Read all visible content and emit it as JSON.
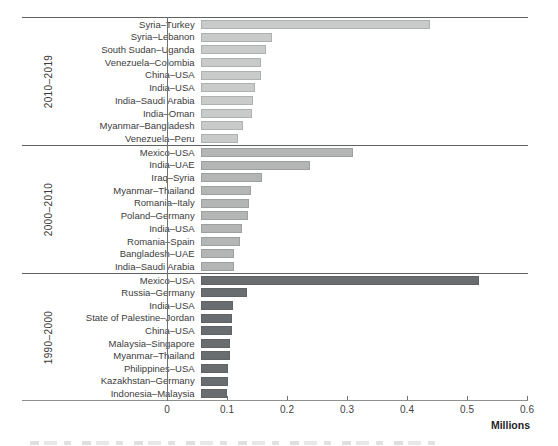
{
  "chart_data": {
    "type": "bar",
    "orientation": "horizontal",
    "xlabel": "Millions",
    "xlim": [
      0,
      0.6
    ],
    "x_ticks": [
      "0",
      "0.1",
      "0.2",
      "0.3",
      "0.4",
      "0.5",
      "0.6"
    ],
    "x_tick_values": [
      0,
      0.1,
      0.2,
      0.3,
      0.4,
      0.5,
      0.6
    ],
    "grid": false,
    "legend": "none",
    "groups": [
      {
        "period": "2010–2019",
        "bar_color": "#c9cbca",
        "bar_border": "#aeb1b0",
        "bars": [
          {
            "label": "Syria–Turkey",
            "value": 0.42
          },
          {
            "label": "Syria–Lebanon",
            "value": 0.13
          },
          {
            "label": "South Sudan–Uganda",
            "value": 0.12
          },
          {
            "label": "Venezuela–Colombia",
            "value": 0.11
          },
          {
            "label": "China–USA",
            "value": 0.11
          },
          {
            "label": "India–USA",
            "value": 0.099
          },
          {
            "label": "India–Saudi Arabia",
            "value": 0.096
          },
          {
            "label": "India–Oman",
            "value": 0.095
          },
          {
            "label": "Myanmar–Bangladesh",
            "value": 0.078
          },
          {
            "label": "Venezuela–Peru",
            "value": 0.068
          }
        ]
      },
      {
        "period": "2000–2010",
        "bar_color": "#b3b6b5",
        "bar_border": "#9da09f",
        "bars": [
          {
            "label": "Mexico–USA",
            "value": 0.28
          },
          {
            "label": "India–UAE",
            "value": 0.2
          },
          {
            "label": "Iraq–Syria",
            "value": 0.112
          },
          {
            "label": "Myanmar–Thailand",
            "value": 0.093
          },
          {
            "label": "Romania–Italy",
            "value": 0.089
          },
          {
            "label": "Poland–Germany",
            "value": 0.087
          },
          {
            "label": "India–USA",
            "value": 0.075
          },
          {
            "label": "Romania–Spain",
            "value": 0.073
          },
          {
            "label": "Bangladesh–UAE",
            "value": 0.062
          },
          {
            "label": "India–Saudi Arabia",
            "value": 0.061
          }
        ]
      },
      {
        "period": "1990–2000",
        "bar_color": "#6a6d6f",
        "bar_border": "#606365",
        "bars": [
          {
            "label": "Mexico–USA",
            "value": 0.51
          },
          {
            "label": "Russia–Germany",
            "value": 0.085
          },
          {
            "label": "India–USA",
            "value": 0.06
          },
          {
            "label": "State of Palestine–Jordan",
            "value": 0.058
          },
          {
            "label": "China–USA",
            "value": 0.058
          },
          {
            "label": "Malaysia–Singapore",
            "value": 0.053
          },
          {
            "label": "Myanmar–Thailand",
            "value": 0.053
          },
          {
            "label": "Philippines–USA",
            "value": 0.051
          },
          {
            "label": "Kazakhstan–Germany",
            "value": 0.05
          },
          {
            "label": "Indonesia–Malaysia",
            "value": 0.048
          }
        ]
      }
    ]
  }
}
